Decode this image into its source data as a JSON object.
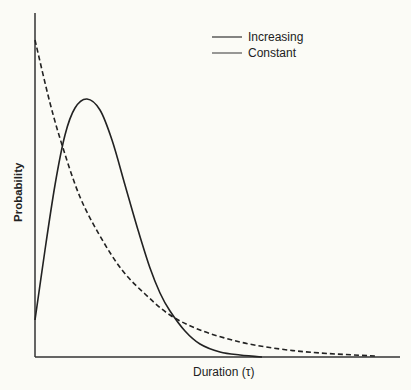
{
  "chart_data": {
    "type": "line",
    "title": "",
    "xlabel": "Duration (τ)",
    "ylabel": "Probability",
    "grid": false,
    "legend_position": "upper-right",
    "ticks": "none",
    "x_range_px": [
      35,
      400
    ],
    "y_range_px": [
      357,
      13
    ],
    "series": [
      {
        "name": "Increasing",
        "style": "solid",
        "description": "Unimodal hazard-increasing distribution: starts low at τ=0, peaks early, then decays to ~0",
        "points_px": [
          [
            35,
            320
          ],
          [
            45,
            250
          ],
          [
            55,
            185
          ],
          [
            65,
            135
          ],
          [
            75,
            108
          ],
          [
            87,
            99
          ],
          [
            100,
            110
          ],
          [
            112,
            140
          ],
          [
            125,
            185
          ],
          [
            138,
            230
          ],
          [
            150,
            268
          ],
          [
            160,
            293
          ],
          [
            170,
            311
          ],
          [
            185,
            331
          ],
          [
            200,
            344
          ],
          [
            220,
            352
          ],
          [
            240,
            355
          ],
          [
            262,
            357
          ]
        ]
      },
      {
        "name": "Constant",
        "style": "dashed",
        "description": "Exponential distribution (constant hazard), monotonically decreasing from maximum at τ=0",
        "points_px": [
          [
            35,
            40
          ],
          [
            50,
            103
          ],
          [
            63,
            148
          ],
          [
            80,
            197
          ],
          [
            100,
            236
          ],
          [
            122,
            270
          ],
          [
            145,
            294
          ],
          [
            170,
            315
          ],
          [
            200,
            330
          ],
          [
            240,
            342
          ],
          [
            280,
            349
          ],
          [
            320,
            353
          ],
          [
            375,
            356
          ]
        ]
      }
    ]
  },
  "legend": {
    "items": [
      {
        "label": "Increasing"
      },
      {
        "label": "Constant"
      }
    ]
  },
  "axes": {
    "xlabel": "Duration (τ)",
    "ylabel": "Probability"
  }
}
